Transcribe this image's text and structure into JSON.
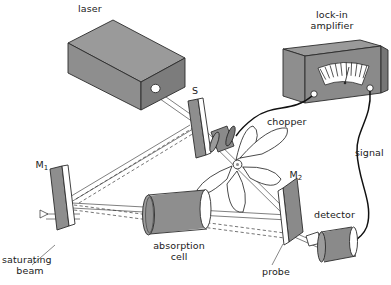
{
  "figure": {
    "background_color": "#ffffff",
    "line_color": "#2b2b2b",
    "body_fill": "#8c8c8c",
    "face_fill_light": "#9e9e9e",
    "face_fill_dark": "#777777",
    "white_fill": "#ffffff",
    "text_color": "#1a1a1a"
  },
  "labels": {
    "laser": "laser",
    "beamsplitter": "S",
    "lockin_line1": "lock-in",
    "lockin_line2": "amplifier",
    "chopper": "chopper",
    "signal": "signal",
    "mirror1": "M",
    "mirror1_sub": "1",
    "mirror2": "M",
    "mirror2_sub": "2",
    "detector": "detector",
    "probe": "probe",
    "absorption_line1": "absorption",
    "absorption_line2": "cell",
    "saturating_line1": "saturating",
    "saturating_line2": "beam"
  },
  "components": [
    {
      "name": "laser",
      "type": "box-3d",
      "label": "laser"
    },
    {
      "name": "beamsplitter",
      "type": "plate",
      "label": "S"
    },
    {
      "name": "lock-in-amplifier",
      "type": "box-3d-with-meter",
      "label": "lock-in amplifier"
    },
    {
      "name": "chopper",
      "type": "bladed-wheel",
      "label": "chopper",
      "blades": 5
    },
    {
      "name": "chopper-motor",
      "type": "cylinder",
      "label": ""
    },
    {
      "name": "mirror-1",
      "type": "plate",
      "label": "M1"
    },
    {
      "name": "mirror-2",
      "type": "plate",
      "label": "M2"
    },
    {
      "name": "absorption-cell",
      "type": "cylinder",
      "label": "absorption cell"
    },
    {
      "name": "detector",
      "type": "cylinder",
      "label": "detector"
    },
    {
      "name": "saturating-beam",
      "type": "arrow",
      "label": "saturating beam"
    },
    {
      "name": "probe-beam",
      "type": "dashed-ray",
      "label": "probe"
    },
    {
      "name": "signal-cable",
      "type": "curved-wire",
      "label": "signal"
    },
    {
      "name": "reference-cable",
      "type": "curved-wire",
      "label": ""
    }
  ],
  "meter": {
    "type": "analog-needle-gauge",
    "tick_count": 11,
    "needle_fraction": 0.5
  }
}
